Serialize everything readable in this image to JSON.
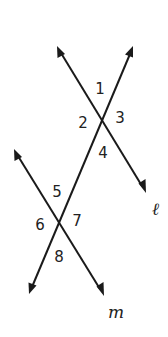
{
  "diagram": {
    "colors": {
      "stroke": "#1a1a1a",
      "text": "#222222",
      "background": "#ffffff"
    },
    "lines": {
      "l": {
        "label": "ℓ",
        "from": [
          57,
          46
        ],
        "to": [
          146,
          193
        ]
      },
      "m": {
        "label": "m",
        "from": [
          14,
          149
        ],
        "to": [
          104,
          296
        ]
      },
      "transversal": {
        "label": "",
        "from": [
          133,
          46
        ],
        "to": [
          29,
          294
        ]
      }
    },
    "intersections": {
      "upper": [
        101,
        119
      ],
      "lower": [
        59,
        221
      ]
    },
    "angles": [
      {
        "label": "1",
        "x": 100,
        "y": 94
      },
      {
        "label": "2",
        "x": 83,
        "y": 128
      },
      {
        "label": "3",
        "x": 120,
        "y": 123
      },
      {
        "label": "4",
        "x": 103,
        "y": 158
      },
      {
        "label": "5",
        "x": 57,
        "y": 197
      },
      {
        "label": "6",
        "x": 40,
        "y": 230
      },
      {
        "label": "7",
        "x": 77,
        "y": 226
      },
      {
        "label": "8",
        "x": 59,
        "y": 262
      }
    ],
    "line_labels": {
      "l": {
        "text": "ℓ",
        "x": 152,
        "y": 215
      },
      "m": {
        "text": "m",
        "x": 108,
        "y": 318
      }
    }
  }
}
